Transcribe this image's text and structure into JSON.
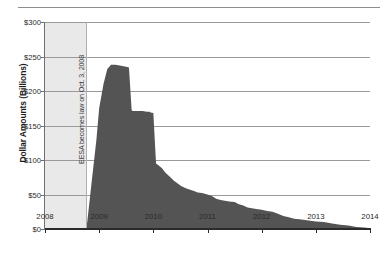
{
  "chart_data": {
    "type": "area",
    "title": "",
    "xlabel": "",
    "ylabel": "Dollar Amounts (Billions)",
    "xlim": [
      2008,
      2014
    ],
    "ylim": [
      0,
      300
    ],
    "grid": true,
    "legend": "none",
    "y_ticks": [
      "$0",
      "$50",
      "$100",
      "$150",
      "$200",
      "$250",
      "$300"
    ],
    "y_tick_values": [
      0,
      50,
      100,
      150,
      200,
      250,
      300
    ],
    "x_ticks": [
      "2008",
      "2009",
      "2010",
      "2011",
      "2012",
      "2013",
      "2014"
    ],
    "x_tick_values": [
      2008,
      2009,
      2010,
      2011,
      2012,
      2013,
      2014
    ],
    "series": [
      {
        "name": "Outstanding Amount",
        "color": "#545454",
        "x": [
          2008.75,
          2008.78,
          2008.85,
          2008.95,
          2009.0,
          2009.08,
          2009.15,
          2009.22,
          2009.3,
          2009.38,
          2009.45,
          2009.5,
          2009.55,
          2009.6,
          2009.62,
          2009.7,
          2009.8,
          2009.88,
          2009.93,
          2009.95,
          2010.0,
          2010.05,
          2010.1,
          2010.16,
          2010.22,
          2010.3,
          2010.38,
          2010.45,
          2010.52,
          2010.6,
          2010.68,
          2010.75,
          2010.82,
          2010.9,
          2010.95,
          2011.0,
          2011.08,
          2011.16,
          2011.24,
          2011.32,
          2011.4,
          2011.5,
          2011.58,
          2011.66,
          2011.74,
          2011.82,
          2011.9,
          2012.0,
          2012.1,
          2012.2,
          2012.3,
          2012.4,
          2012.5,
          2012.6,
          2012.7,
          2012.8,
          2012.9,
          2013.0,
          2013.15,
          2013.3,
          2013.45,
          2013.6,
          2013.75,
          2013.9,
          2014.0
        ],
        "y": [
          0,
          10,
          60,
          130,
          175,
          210,
          232,
          238,
          238,
          237,
          236,
          235,
          234,
          172,
          171,
          171,
          171,
          170,
          170,
          169,
          168,
          95,
          92,
          88,
          82,
          76,
          70,
          66,
          62,
          59,
          57,
          55,
          53,
          52,
          51,
          50,
          48,
          44,
          42,
          41,
          40,
          39,
          36,
          34,
          31,
          30,
          29,
          28,
          26,
          25,
          22,
          19,
          17,
          15,
          14,
          13,
          12,
          11,
          10,
          8,
          6,
          5,
          3,
          2,
          1
        ]
      }
    ],
    "annotations": [
      {
        "name": "eesa-event-line",
        "label": "EESA becomes law on Oct. 3, 2008",
        "x": 2008.75,
        "orientation": "vertical"
      }
    ],
    "shaded_regions": [
      {
        "name": "pre-eesa-shading",
        "x_start": 2008,
        "x_end": 2008.75,
        "color": "#e9e9e9"
      }
    ]
  }
}
